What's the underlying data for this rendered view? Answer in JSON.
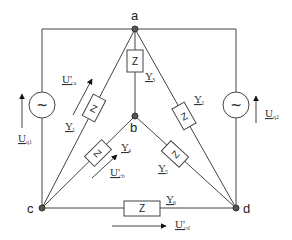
{
  "diagram": {
    "type": "electrical-circuit",
    "nodes": [
      {
        "id": "a",
        "label": "a"
      },
      {
        "id": "b",
        "label": "b"
      },
      {
        "id": "c",
        "label": "c"
      },
      {
        "id": "d",
        "label": "d"
      }
    ],
    "impedance_symbol": "Z",
    "source_symbol": "~",
    "admittances": [
      {
        "id": "Y1",
        "symbol": "Y",
        "sub": "1",
        "between": [
          "c",
          "a"
        ]
      },
      {
        "id": "Y2",
        "symbol": "Y",
        "sub": "2",
        "between": [
          "a",
          "d"
        ]
      },
      {
        "id": "Y3",
        "symbol": "Y",
        "sub": "3",
        "between": [
          "a",
          "b"
        ]
      },
      {
        "id": "Y4",
        "symbol": "Y",
        "sub": "4",
        "between": [
          "c",
          "b"
        ]
      },
      {
        "id": "Y5",
        "symbol": "Y",
        "sub": "5",
        "between": [
          "b",
          "d"
        ]
      },
      {
        "id": "Y6",
        "symbol": "Y",
        "sub": "6",
        "between": [
          "c",
          "d"
        ]
      }
    ],
    "sources": [
      {
        "id": "Uq1",
        "symbol": "U",
        "sub": "q1",
        "between": [
          "c",
          "a"
        ],
        "side": "left"
      },
      {
        "id": "Uq2",
        "symbol": "U",
        "sub": "q2",
        "between": [
          "d",
          "a"
        ],
        "side": "right"
      }
    ],
    "voltages": [
      {
        "id": "Uca",
        "symbol": "U'",
        "sub": "ca"
      },
      {
        "id": "Ucb",
        "symbol": "U'",
        "sub": "cb"
      },
      {
        "id": "Ucd",
        "symbol": "U'",
        "sub": "cd"
      }
    ]
  }
}
